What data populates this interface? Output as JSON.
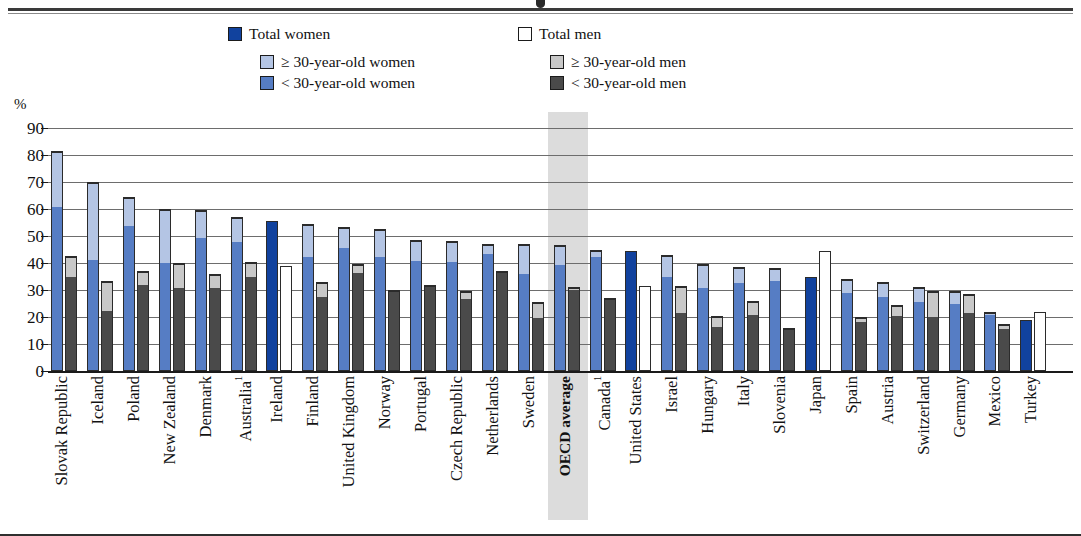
{
  "legend": {
    "rows": [
      [
        {
          "label": "Total women",
          "color": "#11429e",
          "key": "total-women"
        },
        {
          "label": "Total men",
          "color": "#ffffff",
          "key": "total-men"
        }
      ],
      [
        {
          "label": "≥ 30-year-old women",
          "color": "#b4c5e4",
          "key": "women-30-plus"
        },
        {
          "label": "≥ 30-year-old men",
          "color": "#c8c8c8",
          "key": "men-30-plus"
        }
      ],
      [
        {
          "label": "< 30-year-old women",
          "color": "#567dc4",
          "key": "women-under-30"
        },
        {
          "label": "< 30-year-old men",
          "color": "#4a4a4a",
          "key": "men-under-30"
        }
      ]
    ]
  },
  "axis": {
    "unit": "%",
    "yticks": [
      "90",
      "80",
      "70",
      "60",
      "50",
      "40",
      "30",
      "20",
      "10",
      "0"
    ]
  },
  "colors": {
    "women_under30": "#567dc4",
    "women_30plus": "#b4c5e4",
    "men_under30": "#4a4a4a",
    "men_30plus": "#c8c8c8",
    "total_women": "#11429e",
    "total_men": "#ffffff",
    "outline": "#2b2b2b",
    "oecd_band": "#dcdcdc",
    "gridline": "#6d6d6d"
  },
  "chart_data": {
    "type": "bar",
    "title": "",
    "xlabel": "",
    "ylabel": "%",
    "ylim": [
      0,
      90
    ],
    "ytick_step": 10,
    "grid": true,
    "legend_position": "top",
    "stacked": true,
    "highlight_category": "OECD average",
    "categories": [
      "Slovak Republic",
      "Iceland",
      "Poland",
      "New Zealand",
      "Denmark",
      "Australia¹",
      "Ireland",
      "Finland",
      "United Kingdom",
      "Norway",
      "Portugal",
      "Czech Republic",
      "Netherlands",
      "Sweden",
      "OECD average",
      "Canada¹",
      "United States",
      "Israel",
      "Hungary",
      "Italy",
      "Slovenia",
      "Japan",
      "Spain",
      "Austria",
      "Switzerland",
      "Germany",
      "Mexico",
      "Turkey"
    ],
    "series": [
      {
        "name": "< 30-year-old women",
        "color": "#567dc4",
        "values": [
          61,
          41,
          54,
          40,
          49.5,
          48,
          null,
          42.5,
          46,
          42.5,
          41,
          40.5,
          43.5,
          36,
          39.5,
          42.5,
          null,
          35,
          31,
          33,
          33.5,
          null,
          29,
          27.5,
          26,
          25,
          21,
          null
        ]
      },
      {
        "name": "≥ 30-year-old women",
        "color": "#b4c5e4",
        "values": [
          20.5,
          29,
          10.5,
          20,
          10,
          9,
          null,
          12,
          7.5,
          10,
          7.5,
          7.5,
          3.5,
          11,
          7,
          2.5,
          null,
          8,
          8.5,
          5.5,
          4.5,
          null,
          5,
          5.5,
          5,
          4.5,
          1,
          null
        ]
      },
      {
        "name": "Total women",
        "color": "#11429e",
        "values": [
          null,
          null,
          null,
          null,
          null,
          null,
          55.5,
          null,
          null,
          null,
          null,
          null,
          null,
          null,
          null,
          null,
          44.5,
          null,
          null,
          null,
          null,
          35,
          null,
          null,
          null,
          null,
          null,
          19
        ]
      },
      {
        "name": "< 30-year-old men",
        "color": "#4a4a4a",
        "values": [
          35,
          22.5,
          32,
          31,
          31,
          35,
          null,
          27.5,
          36.5,
          29.5,
          31.5,
          27,
          36.5,
          20,
          30.5,
          26.5,
          null,
          21.5,
          16.5,
          21,
          15.5,
          null,
          18.5,
          20.5,
          20,
          21.5,
          16,
          null
        ]
      },
      {
        "name": "≥ 30-year-old men",
        "color": "#c8c8c8",
        "values": [
          7.5,
          11,
          5,
          9,
          5,
          5.5,
          null,
          5.5,
          3,
          0.5,
          0.5,
          2.5,
          0.5,
          5.5,
          0.5,
          0.5,
          null,
          10,
          4,
          5,
          0.5,
          null,
          1.5,
          4,
          9.5,
          7,
          1.5,
          null
        ]
      },
      {
        "name": "Total men",
        "color": "#ffffff",
        "values": [
          null,
          null,
          null,
          null,
          null,
          null,
          39,
          null,
          null,
          null,
          null,
          null,
          null,
          null,
          null,
          null,
          31.5,
          null,
          null,
          null,
          null,
          44.5,
          null,
          null,
          null,
          null,
          null,
          22
        ]
      }
    ],
    "women_totals": [
      81.5,
      70,
      64.5,
      60,
      59.5,
      57,
      55.5,
      54.5,
      53.5,
      52.5,
      48.5,
      48,
      47,
      47,
      46.5,
      45,
      44.5,
      43,
      39.5,
      38.5,
      38,
      35,
      34,
      33,
      31,
      29.5,
      22,
      19
    ],
    "men_totals": [
      42.5,
      33.5,
      37,
      40,
      36,
      40.5,
      39,
      33,
      39.5,
      30,
      32,
      29.5,
      37,
      25.5,
      31,
      27,
      31.5,
      31.5,
      20.5,
      26,
      16,
      44.5,
      20,
      24.5,
      29.5,
      28.5,
      17.5,
      22
    ]
  }
}
